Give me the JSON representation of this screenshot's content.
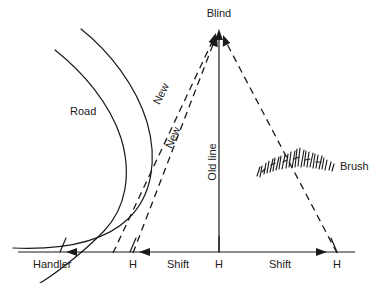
{
  "diagram": {
    "background_color": "#ffffff",
    "ink_color": "#1a1a1a",
    "width": 376,
    "height": 283
  },
  "labels": {
    "blind": "Blind",
    "road": "Road",
    "new_upper": "New",
    "new_lower": "New",
    "old_line": "Old line",
    "brush": "Brush",
    "handler": "Handler",
    "shift_left": "Shift",
    "shift_right": "Shift",
    "h_left": "H",
    "h_center": "H",
    "h_right": "H"
  },
  "markers": {
    "h_positions": [
      {
        "label": "H",
        "x": 133,
        "y": 265
      },
      {
        "label": "H",
        "x": 219,
        "y": 265
      },
      {
        "label": "H",
        "x": 337,
        "y": 265
      }
    ]
  },
  "icons": {
    "apex_arrow_center": "arrow-up-icon",
    "apex_arrow_left": "arrow-up-icon",
    "apex_arrow_right": "arrow-up-icon",
    "shift_arrow_left_outer": "arrow-left-icon",
    "shift_arrow_left_inner": "arrow-left-icon",
    "shift_arrow_right": "arrow-right-icon",
    "brush_texture": "brush-texture-icon"
  },
  "geometry": {
    "baseline_y": 252,
    "apex": {
      "x": 219,
      "y": 31
    },
    "baseline_x_start": 18,
    "baseline_x_end": 355
  }
}
